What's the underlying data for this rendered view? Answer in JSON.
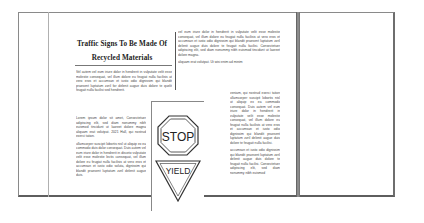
{
  "document": {
    "title_line1": "Traffic Signs To Be Made Of",
    "title_line2": "Recycled Materials",
    "left_column": {
      "paragraphs": [
        "Vel autem vel eum iriure dolor in hendrerit in vulputate velit esse molestie consequat, vel illum dolore eu feugiat nulla facilisis at vero eros et accumsan et iusto odio dignissim qui blandit praesent luptatum zzril for delenit augue duis dolore te quelit feugait nulla facilisi sed hendrerit."
      ]
    },
    "left_narrow_column": {
      "paragraphs": [
        "Lorem ipsum dolor sit amet, Consectetuer adipiscing elit, sed diam nonummy nibh euismod tincidunt ut laoreet dolore magna aliquam erat volutpat. 2021 Hall, qui nostrud exerci tation.",
        "ullamcorper suscipit lobortis nisl ut aliquip ex ea commodo duis dolor consequat. Duis autem vel eum iriure dolor in hendrerit in disceto vulputate velit esse molestie lectis consequat, vel illum dolore eu feugiat nulla facilisis at vero eros et accumsan et iusto odio soluta, dignissim qui blandit praesent luptatum zzril delenit augue duis."
      ]
    },
    "right_column": {
      "paragraphs": [
        "vel eum iriure dolor in hendrerit in vulputate velit esse molestie consequat, vel illum dolore eu feugiat nulla facilisis at vero eros et accumsan et iusto odio dignissim qui blandit praesent luptatum zzril delenit augue duis dolore te feugait nulla facilisi. Consectetuer adipiscing elit, sed diam nonummy nibh euismod tincidunt ut laoreet dolore magna.",
        "aliquam erat volutpat. Ut wisi enim ad minim"
      ]
    },
    "right_lower_column": {
      "paragraphs": [
        "veniam, qui nostrud exerci tation ullamcorper suscipit lobortis nisl ut aliquip ex ea commodo consequat. Duis autem vel eum iriure dolor in hendrerit in vulputate velit esse molestie consequat, vel illum dolore eu feugiat nulla facilisis at vero eros et accumsan et iusto odio dignissim qui blandit praesent luptatum zzril delenit augue duis dolore te feugait nulla facilisi.",
        "accumsan et iusto odio dignissim qui blandit praesent luptatum zzril delenit augue duis dolore te feugait nulla facilisi. Consectetuer adipiscing elit, sed diam nonummy nibh euismod"
      ]
    },
    "signs": {
      "stop_label": "STOP",
      "yield_label": "YIELD"
    }
  }
}
